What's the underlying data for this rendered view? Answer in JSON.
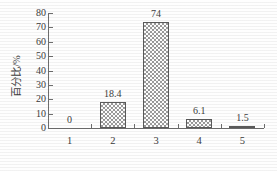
{
  "chart_data": {
    "type": "bar",
    "title": "",
    "xlabel": "",
    "ylabel": "百分比/%",
    "categories": [
      "1",
      "2",
      "3",
      "4",
      "5"
    ],
    "values": [
      0,
      18.4,
      74,
      6.1,
      1.5
    ],
    "data_labels": [
      "0",
      "18.4",
      "74",
      "6.1",
      "1.5"
    ],
    "ylim": [
      0,
      80
    ],
    "ytick_labels": [
      "0",
      "10",
      "20",
      "30",
      "40",
      "50",
      "60",
      "70",
      "80"
    ],
    "ytick_values": [
      0,
      10,
      20,
      30,
      40,
      50,
      60,
      70,
      80
    ],
    "grid": false,
    "legend": false,
    "legend_position": "none",
    "bar_fill_pattern": "checkerboard",
    "bar_fill_color": "#9b9b9b",
    "bar_edge_color": "#5a5a5a",
    "axis_color": "#6e6e6e",
    "text_color": "#3d3d3d",
    "background_color": "#fefefe"
  }
}
